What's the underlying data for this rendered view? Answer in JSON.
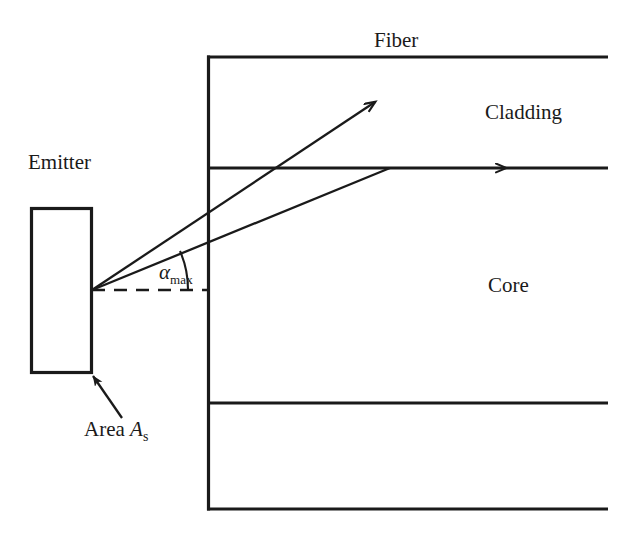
{
  "figure": {
    "background_color": "#ffffff",
    "line_color": "#1a1a1a",
    "width": 619,
    "height": 542
  },
  "labels": {
    "fiber": "Fiber",
    "cladding": "Cladding",
    "core": "Core",
    "emitter": "Emitter",
    "area_prefix": "Area ",
    "area_symbol": "A",
    "area_subscript": "s",
    "alpha_symbol": "α",
    "alpha_subscript": "max"
  },
  "diagram_data": {
    "type": "schematic",
    "elements": [
      {
        "name": "fiber-outer-top-edge",
        "kind": "line",
        "from": [
          208,
          57
        ],
        "to": [
          608,
          57
        ]
      },
      {
        "name": "fiber-left-edge",
        "kind": "line",
        "from": [
          208,
          57
        ],
        "to": [
          208,
          509
        ]
      },
      {
        "name": "fiber-outer-bottom-edge",
        "kind": "line",
        "from": [
          208,
          509
        ],
        "to": [
          608,
          509
        ]
      },
      {
        "name": "core-cladding-upper-boundary",
        "kind": "line",
        "from": [
          208,
          168
        ],
        "to": [
          608,
          168
        ]
      },
      {
        "name": "core-cladding-lower-boundary",
        "kind": "line",
        "from": [
          208,
          403
        ],
        "to": [
          608,
          403
        ]
      },
      {
        "name": "emitter-rectangle",
        "kind": "rect",
        "x": 30,
        "y": 207,
        "width": 62,
        "height": 166
      },
      {
        "name": "optical-axis-dashed",
        "kind": "dashed-line",
        "from": [
          92,
          290
        ],
        "to": [
          208,
          290
        ]
      },
      {
        "name": "escaping-ray",
        "kind": "arrow",
        "from": [
          92,
          290
        ],
        "to": [
          377,
          101
        ]
      },
      {
        "name": "guided-ray",
        "kind": "line",
        "from": [
          92,
          290
        ],
        "to": [
          388,
          168
        ]
      },
      {
        "name": "guided-ray-continuation",
        "kind": "arrow",
        "from": [
          208,
          168
        ],
        "to": [
          608,
          168
        ],
        "arrow_at": [
          505,
          168
        ]
      },
      {
        "name": "acceptance-angle-arc",
        "kind": "arc",
        "center": [
          92,
          290
        ],
        "radius": 96,
        "start_deg": 0,
        "end_deg": 24
      },
      {
        "name": "area-callout-arrow",
        "kind": "arrow",
        "from": [
          120,
          416
        ],
        "to": [
          91,
          374
        ]
      }
    ],
    "annotations": [
      {
        "name": "fiber",
        "text": "Fiber",
        "at": [
          400,
          40
        ]
      },
      {
        "name": "cladding",
        "text": "Cladding",
        "at": [
          527,
          113
        ]
      },
      {
        "name": "core",
        "text": "Core",
        "at": [
          511,
          286
        ]
      },
      {
        "name": "emitter",
        "text": "Emitter",
        "at": [
          61,
          163
        ]
      },
      {
        "name": "area-as",
        "text": "Area A_s",
        "at": [
          122,
          430
        ]
      },
      {
        "name": "alpha-max",
        "text": "α_max",
        "at": [
          180,
          274
        ]
      }
    ]
  }
}
